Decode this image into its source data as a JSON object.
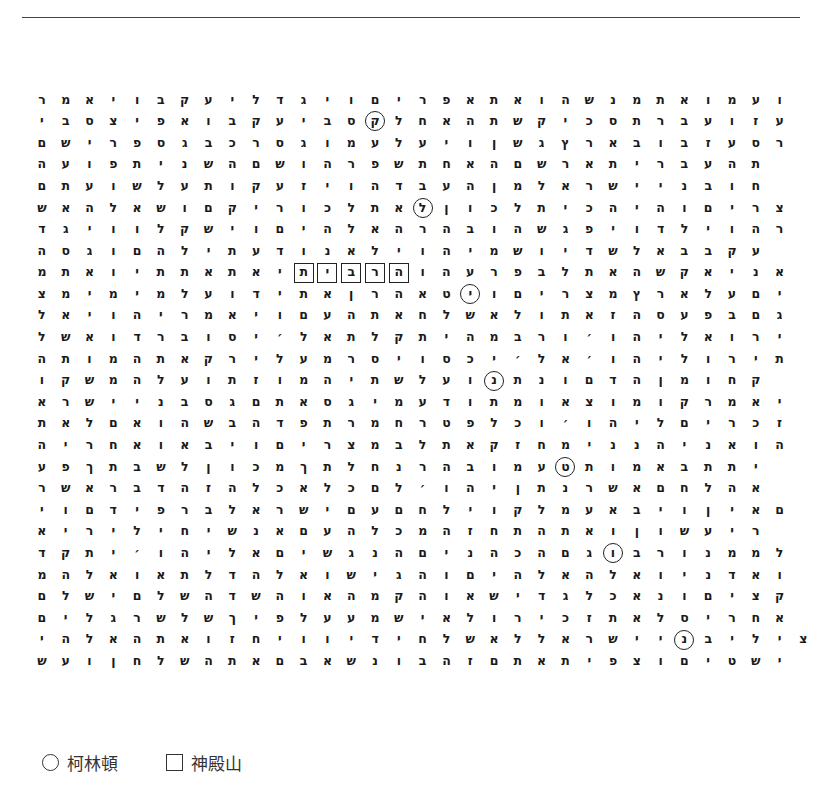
{
  "grid": {
    "rows": [
      "ר מ א י ו ב ק ע י ל ד ג י ו ם י ר פ א ת א ו ה ש נ מ ת א ו מ ע ו",
      "י ב ס צ י פ א ו ב ק ע י ב ס (ק) ל ח א ה ת ש ק י כ ס ת ר ב ע ו ז ע",
      "ם ש י ר פ ס ג ב כ ר ס ג ו מ ע ל ע י ו ן ש ג ץ ר א ב ו ב ז ע ס ר",
      "ה ע ו פ ת י נ ש ה ם ש ו ה ר פ ש ת ח א ה ם ש ר א ת י ר ב ע ה ת",
      "ם ת ע ו ש ל ע ת ו ק ע ז י ו ה ד ב ע ה ן מ ל א ר ש י י נ ב ו ח",
      "ש א ה ל א ש ו ם ק י ר ו כ ל ת א (ל) ן ו כ ל ת י כ ה י ה ו ם י ר צ",
      "ד ג י ו ו ל ק ש י ו ם י ה ל א ה ר ה ב ו ה ש ג פ י ו ד ל י ו ה ר",
      "ה ס ג ו ם ה ל י ת ע ד ו נ א ל י ו ה י מ ש ו י ד ש ל א ב ב ק ע",
      "מ ת א ו י ת ת א ת א י [ת] [י] [ב] [ר] [ה] ו ה ע ר פ ב ל ת א ה ש ק א י נ א",
      "צ מ י מ י מ ל ע ו ד י ת א ן ר ה א ט (י) ו ם י ר צ מ ץ ר א ל ע ם י",
      "ל א י ו ה י ר מ א י ו ם ע ה ת א ח ל ש א ל ו ת א ז ה ס ע פ ב ם ג",
      "ל ש א ו ד ר ב ו ס י ׳ ל א ת ל ק ת י ה מ ב ר ו ׳ ו ה י ל א ו ר י",
      "ה ת ו מ ה ת א ק ר י ל ע מ ר ס י ו ס כ י ׳ ל א ׳ ו ה י ל ו ר י ת",
      "ו ק ש מ ה ל ע ו ת ז ו מ ה י ת ש ל ע ו (נ) ת נ ו ם ד ה ן מ ו ח ק",
      "א ר ש י י נ ב ס ג ם ת א ס ג י מ ע ד ו ת מ ו א צ ו מ ו ק ר מ א י",
      "ת א ל ם א ו ה ש ב ה ד פ ת ר מ ח ר ט פ ל כ ו ׳ ו ה י ל ם י ר כ ז",
      "ה י ר ח א ו א ב י ו ם י ר צ מ ב ל ת א ק ז ח מ י נ נ ה י נ א ו ה",
      "ע פ ך ת ב ש ל ן ו כ מ ך ת ל ח נ ר ה ב ו מ ע (ט) ת ו מ א ב ת ת י",
      "ר ש א ר ב ד ה ז ה ל כ א ל כ ם ל ׳ ו ה י ן ת נ ר ש א ם ח ל ה א",
      "י ו ם ד י פ ר ב ל א ר ש י ם ע ם ח ל י ו ק ל מ ע א ב י ו ן י א ם",
      "א י ר י ל י ח י ש נ א ם ע ה ל כ מ ה ז ח ת ה ת א ו ן ו ש ע י ר",
      "ד ק ת י ׳ ו ה י ל א ם י ש ג נ ה ם י נ ה כ ה ם ג (ו) ב ר ו נ מ מ ל",
      "מ ה ל א ו א ת ל ד ה ל א ו ש י ג ה ו ם י ה ל א ה ל א ו י נ ד א ו",
      "ם ל ש י ם ל ש ה ד ש ה ו א ה מ ק ה ו א ש י ד ג ל כ א נ ו ם י צ ק",
      "ם י ל ג ר ש ל ש ך י פ ל ע ע מ ש י א ל ו ר י כ ז ת א ל ס י ר ח א",
      "י ה ל א ה ת א ו ז ח י ו ו י ד י ח ל ש א ל ל א ר ש י י (נ) ב י ל י צ",
      "ש ע ו ן ח ל ש ה ת א ם ב א ש נ ו ב ה ז ם ת א ת י פ צ ו ם י ט ש י"
    ]
  },
  "legend": {
    "circle_label": "柯林頓",
    "square_label": "神殿山"
  }
}
